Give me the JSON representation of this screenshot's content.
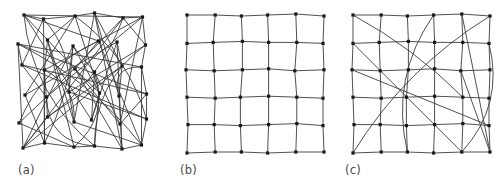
{
  "figure": {
    "type": "network-diagram",
    "background_color": "#ffffff",
    "edge_color": "#3c3c3c",
    "node_color": "#1a1a1a",
    "node_shape": "square",
    "node_size_px": 3.2,
    "edge_width_px": 0.9,
    "panel_count": 3
  },
  "panels": [
    {
      "id": "a",
      "caption": "(a)",
      "kind": "random",
      "node_count": 36,
      "grid_rows": 6,
      "grid_cols": 6,
      "jittered": true,
      "origin": [
        22,
        16
      ],
      "spacing": [
        24.5,
        26.0
      ],
      "jitter": [
        [
          2,
          -1
        ],
        [
          -3,
          3
        ],
        [
          4,
          0
        ],
        [
          -1,
          -3
        ],
        [
          3,
          2
        ],
        [
          -2,
          1
        ],
        [
          -4,
          2
        ],
        [
          1,
          -2
        ],
        [
          2,
          4
        ],
        [
          3,
          -1
        ],
        [
          -3,
          0
        ],
        [
          1,
          3
        ],
        [
          0,
          -3
        ],
        [
          -2,
          2
        ],
        [
          4,
          1
        ],
        [
          -1,
          4
        ],
        [
          2,
          -2
        ],
        [
          -3,
          -1
        ],
        [
          3,
          1
        ],
        [
          0,
          3
        ],
        [
          -2,
          -2
        ],
        [
          4,
          -1
        ],
        [
          -1,
          2
        ],
        [
          2,
          0
        ],
        [
          -3,
          3
        ],
        [
          1,
          -3
        ],
        [
          3,
          2
        ],
        [
          -4,
          0
        ],
        [
          0,
          4
        ],
        [
          2,
          -1
        ],
        [
          1,
          2
        ],
        [
          -2,
          -3
        ],
        [
          3,
          1
        ],
        [
          -1,
          0
        ],
        [
          2,
          3
        ],
        [
          -3,
          -1
        ]
      ],
      "edges": [
        [
          0,
          14
        ],
        [
          0,
          27
        ],
        [
          0,
          9
        ],
        [
          0,
          33
        ],
        [
          1,
          20
        ],
        [
          1,
          31
        ],
        [
          1,
          12
        ],
        [
          2,
          18
        ],
        [
          2,
          29
        ],
        [
          2,
          7
        ],
        [
          3,
          22
        ],
        [
          3,
          16
        ],
        [
          3,
          34
        ],
        [
          4,
          11
        ],
        [
          4,
          25
        ],
        [
          4,
          30
        ],
        [
          5,
          13
        ],
        [
          5,
          28
        ],
        [
          5,
          19
        ],
        [
          6,
          23
        ],
        [
          6,
          35
        ],
        [
          6,
          17
        ],
        [
          7,
          26
        ],
        [
          7,
          32
        ],
        [
          8,
          15
        ],
        [
          8,
          21
        ],
        [
          8,
          30
        ],
        [
          9,
          24
        ],
        [
          9,
          35
        ],
        [
          10,
          18
        ],
        [
          10,
          27
        ],
        [
          11,
          33
        ],
        [
          11,
          20
        ],
        [
          12,
          29
        ],
        [
          12,
          23
        ],
        [
          13,
          31
        ],
        [
          13,
          26
        ],
        [
          14,
          34
        ],
        [
          14,
          21
        ],
        [
          15,
          28
        ],
        [
          15,
          32
        ],
        [
          16,
          25
        ],
        [
          16,
          30
        ],
        [
          17,
          22
        ],
        [
          17,
          35
        ],
        [
          18,
          31
        ],
        [
          19,
          24
        ],
        [
          19,
          33
        ],
        [
          20,
          29
        ],
        [
          21,
          27
        ],
        [
          22,
          34
        ],
        [
          23,
          28
        ],
        [
          24,
          32
        ],
        [
          25,
          30
        ],
        [
          26,
          35
        ],
        [
          0,
          5
        ],
        [
          5,
          11
        ],
        [
          11,
          17
        ],
        [
          17,
          23
        ],
        [
          23,
          29
        ],
        [
          29,
          35
        ],
        [
          30,
          31
        ],
        [
          31,
          32
        ],
        [
          32,
          33
        ],
        [
          33,
          34
        ],
        [
          34,
          35
        ],
        [
          0,
          1
        ],
        [
          1,
          2
        ],
        [
          2,
          3
        ],
        [
          3,
          4
        ],
        [
          4,
          5
        ],
        [
          6,
          12
        ],
        [
          12,
          19
        ],
        [
          7,
          13
        ],
        [
          13,
          25
        ],
        [
          8,
          20
        ],
        [
          20,
          26
        ],
        [
          9,
          14
        ],
        [
          14,
          28
        ],
        [
          10,
          16
        ],
        [
          16,
          22
        ],
        [
          15,
          27
        ],
        [
          21,
          33
        ],
        [
          2,
          21
        ],
        [
          4,
          19
        ],
        [
          6,
          30
        ],
        [
          10,
          34
        ],
        [
          3,
          26
        ],
        [
          8,
          31
        ]
      ],
      "curved_edges": [
        [
          0,
          33
        ],
        [
          2,
          29
        ],
        [
          4,
          25
        ],
        [
          6,
          35
        ],
        [
          9,
          24
        ],
        [
          13,
          26
        ],
        [
          15,
          32
        ],
        [
          17,
          22
        ],
        [
          19,
          33
        ],
        [
          8,
          31
        ],
        [
          1,
          20
        ],
        [
          11,
          33
        ]
      ]
    },
    {
      "id": "b",
      "caption": "(b)",
      "kind": "regular-lattice",
      "node_count": 36,
      "grid_rows": 6,
      "grid_cols": 6,
      "jittered": false,
      "origin": [
        21,
        15
      ],
      "spacing": [
        27.2,
        27.4
      ],
      "jitter": [
        [
          0,
          0
        ],
        [
          1,
          0
        ],
        [
          0,
          1
        ],
        [
          -1,
          0
        ],
        [
          0,
          -1
        ],
        [
          1,
          1
        ],
        [
          0,
          1
        ],
        [
          -1,
          0
        ],
        [
          1,
          -1
        ],
        [
          0,
          0
        ],
        [
          1,
          0
        ],
        [
          0,
          1
        ],
        [
          -1,
          0
        ],
        [
          0,
          1
        ],
        [
          1,
          0
        ],
        [
          0,
          -1
        ],
        [
          -1,
          1
        ],
        [
          1,
          0
        ],
        [
          0,
          0
        ],
        [
          1,
          1
        ],
        [
          -1,
          0
        ],
        [
          0,
          -1
        ],
        [
          1,
          0
        ],
        [
          0,
          1
        ],
        [
          1,
          0
        ],
        [
          0,
          0
        ],
        [
          -1,
          1
        ],
        [
          0,
          0
        ],
        [
          1,
          -1
        ],
        [
          0,
          1
        ],
        [
          0,
          1
        ],
        [
          1,
          0
        ],
        [
          0,
          0
        ],
        [
          -1,
          1
        ],
        [
          0,
          0
        ],
        [
          1,
          0
        ]
      ],
      "edges": [],
      "curved_edges": []
    },
    {
      "id": "c",
      "caption": "(c)",
      "kind": "small-world",
      "node_count": 36,
      "grid_rows": 6,
      "grid_cols": 6,
      "jittered": false,
      "origin": [
        21,
        15
      ],
      "spacing": [
        27.2,
        27.4
      ],
      "jitter": [
        [
          0,
          0
        ],
        [
          1,
          0
        ],
        [
          0,
          1
        ],
        [
          -1,
          0
        ],
        [
          0,
          -1
        ],
        [
          1,
          1
        ],
        [
          0,
          1
        ],
        [
          -1,
          0
        ],
        [
          1,
          -1
        ],
        [
          0,
          0
        ],
        [
          1,
          0
        ],
        [
          0,
          1
        ],
        [
          -1,
          0
        ],
        [
          0,
          1
        ],
        [
          1,
          0
        ],
        [
          0,
          -1
        ],
        [
          -1,
          1
        ],
        [
          1,
          0
        ],
        [
          0,
          0
        ],
        [
          1,
          1
        ],
        [
          -1,
          0
        ],
        [
          0,
          -1
        ],
        [
          1,
          0
        ],
        [
          0,
          1
        ],
        [
          1,
          0
        ],
        [
          0,
          0
        ],
        [
          -1,
          1
        ],
        [
          0,
          0
        ],
        [
          1,
          -1
        ],
        [
          0,
          1
        ],
        [
          0,
          1
        ],
        [
          1,
          0
        ],
        [
          0,
          0
        ],
        [
          -1,
          1
        ],
        [
          0,
          0
        ],
        [
          1,
          0
        ]
      ],
      "shortcut_count": 8,
      "edges": [
        [
          0,
          22
        ],
        [
          6,
          34
        ],
        [
          12,
          29
        ],
        [
          3,
          32
        ],
        [
          16,
          35
        ],
        [
          5,
          30
        ],
        [
          11,
          34
        ],
        [
          4,
          35
        ]
      ],
      "curved_edges": [
        [
          0,
          22
        ],
        [
          5,
          30
        ],
        [
          11,
          34
        ],
        [
          3,
          32
        ]
      ]
    }
  ]
}
